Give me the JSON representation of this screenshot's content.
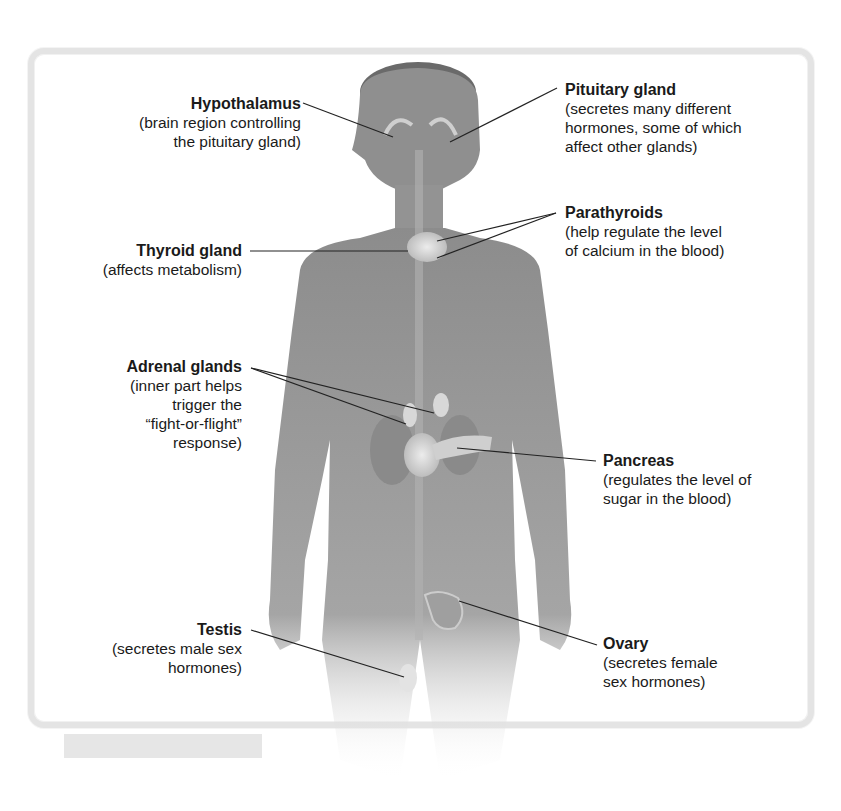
{
  "diagram": {
    "labels": [
      {
        "id": "hypothalamus",
        "title": "Hypothalamus",
        "desc": "(brain region controlling\nthe pituitary gland)",
        "side": "left"
      },
      {
        "id": "pituitary",
        "title": "Pituitary gland",
        "desc": "(secretes many different\nhormones, some of which\naffect other glands)",
        "side": "right"
      },
      {
        "id": "thyroid",
        "title": "Thyroid gland",
        "desc": "(affects metabolism)",
        "side": "left"
      },
      {
        "id": "parathyroids",
        "title": "Parathyroids",
        "desc": "(help regulate the level\nof calcium in the blood)",
        "side": "right"
      },
      {
        "id": "adrenal",
        "title": "Adrenal glands",
        "desc": "(inner part helps\ntrigger the\n“fight-or-flight”\nresponse)",
        "side": "left"
      },
      {
        "id": "pancreas",
        "title": "Pancreas",
        "desc": "(regulates the level of\nsugar in the blood)",
        "side": "right"
      },
      {
        "id": "testis",
        "title": "Testis",
        "desc": "(secretes male sex\nhormones)",
        "side": "left"
      },
      {
        "id": "ovary",
        "title": "Ovary",
        "desc": "(secretes female\nsex hormones)",
        "side": "right"
      }
    ],
    "colors": {
      "frame": "#e4e4e4",
      "body": "#9a9a9a",
      "leader": "#222222",
      "text": "#1a1a1a"
    }
  }
}
